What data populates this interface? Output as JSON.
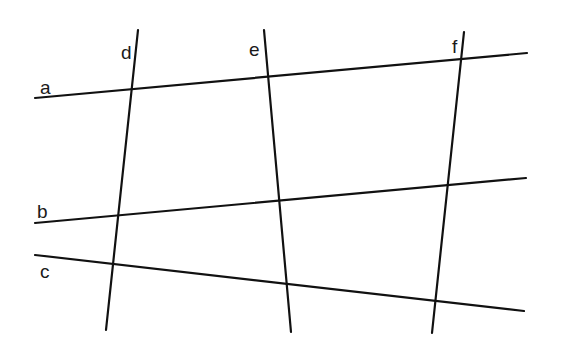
{
  "diagram": {
    "line_color": "#111111",
    "lines": [
      {
        "name": "a",
        "x1": 35,
        "y1": 98,
        "x2": 527,
        "y2": 53
      },
      {
        "name": "b",
        "x1": 35,
        "y1": 223,
        "x2": 526,
        "y2": 178
      },
      {
        "name": "c",
        "x1": 35,
        "y1": 255,
        "x2": 524,
        "y2": 311
      },
      {
        "name": "d",
        "x1": 138,
        "y1": 30,
        "x2": 106,
        "y2": 330
      },
      {
        "name": "e",
        "x1": 264,
        "y1": 30,
        "x2": 291,
        "y2": 332
      },
      {
        "name": "f",
        "x1": 464,
        "y1": 32,
        "x2": 432,
        "y2": 333
      }
    ],
    "labels": [
      {
        "text": "a",
        "x": 40,
        "y": 78
      },
      {
        "text": "b",
        "x": 37,
        "y": 202
      },
      {
        "text": "c",
        "x": 40,
        "y": 262
      },
      {
        "text": "d",
        "x": 121,
        "y": 43
      },
      {
        "text": "e",
        "x": 249,
        "y": 40
      },
      {
        "text": "f",
        "x": 452,
        "y": 37
      }
    ]
  }
}
